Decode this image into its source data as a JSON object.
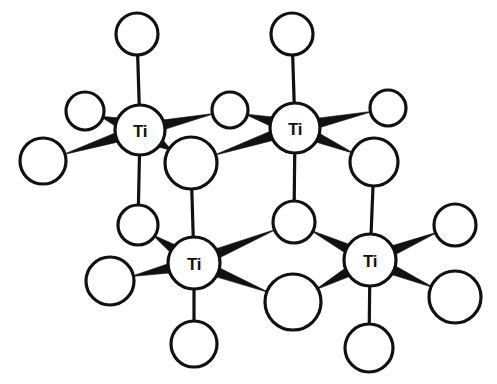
{
  "figure": {
    "kind": "molecular-structure-diagram",
    "background_color": "#ffffff",
    "line_color": "#111111",
    "atom_fill_color": "#ffffff",
    "canvas": {
      "width": 497,
      "height": 384
    }
  },
  "metal_atoms": [
    {
      "id": "ti-top-left",
      "label": "Ti",
      "cx": 140,
      "cy": 130,
      "r": 25
    },
    {
      "id": "ti-top-right",
      "label": "Ti",
      "cx": 295,
      "cy": 128,
      "r": 25
    },
    {
      "id": "ti-bottom-left",
      "label": "Ti",
      "cx": 194,
      "cy": 263,
      "r": 26
    },
    {
      "id": "ti-bottom-right",
      "label": "Ti",
      "cx": 370,
      "cy": 260,
      "r": 26
    }
  ],
  "ligand_atoms": [
    {
      "id": "o-tl-up",
      "cx": 137,
      "cy": 34,
      "r": 21
    },
    {
      "id": "o-tl-upleft",
      "cx": 85,
      "cy": 111,
      "r": 19
    },
    {
      "id": "o-tl-left",
      "cx": 43,
      "cy": 161,
      "r": 23
    },
    {
      "id": "o-tr-up",
      "cx": 292,
      "cy": 34,
      "r": 21
    },
    {
      "id": "o-tr-upright",
      "cx": 388,
      "cy": 108,
      "r": 18
    },
    {
      "id": "o-tr-right",
      "cx": 374,
      "cy": 162,
      "r": 24
    },
    {
      "id": "o-bridge-top",
      "cx": 230,
      "cy": 110,
      "r": 18
    },
    {
      "id": "o-bridge-front",
      "cx": 191,
      "cy": 163,
      "r": 26
    },
    {
      "id": "o-bl-upleft",
      "cx": 138,
      "cy": 225,
      "r": 20
    },
    {
      "id": "o-bl-left",
      "cx": 110,
      "cy": 281,
      "r": 24
    },
    {
      "id": "o-bl-down",
      "cx": 194,
      "cy": 344,
      "r": 23
    },
    {
      "id": "o-bridge-back",
      "cx": 294,
      "cy": 222,
      "r": 21
    },
    {
      "id": "o-bridge-low",
      "cx": 293,
      "cy": 302,
      "r": 28
    },
    {
      "id": "o-br-upright",
      "cx": 455,
      "cy": 225,
      "r": 21
    },
    {
      "id": "o-br-right",
      "cx": 455,
      "cy": 297,
      "r": 26
    },
    {
      "id": "o-br-down",
      "cx": 369,
      "cy": 348,
      "r": 24
    }
  ],
  "wedge_bonds": [
    {
      "id": "bond-tl-upleft",
      "from": "ti-top-left",
      "to": "o-tl-upleft"
    },
    {
      "id": "bond-tl-left",
      "from": "ti-top-left",
      "to": "o-tl-left"
    },
    {
      "id": "bond-tl-bridgetop",
      "from": "ti-top-left",
      "to": "o-bridge-top"
    },
    {
      "id": "bond-tl-bridgefront",
      "from": "ti-top-left",
      "to": "o-bridge-front"
    },
    {
      "id": "bond-tr-bridgetop",
      "from": "ti-top-right",
      "to": "o-bridge-top"
    },
    {
      "id": "bond-tr-bridgefront",
      "from": "ti-top-right",
      "to": "o-bridge-front"
    },
    {
      "id": "bond-tr-upright",
      "from": "ti-top-right",
      "to": "o-tr-upright"
    },
    {
      "id": "bond-tr-right",
      "from": "ti-top-right",
      "to": "o-tr-right"
    },
    {
      "id": "bond-bl-upleft",
      "from": "ti-bottom-left",
      "to": "o-bl-upleft"
    },
    {
      "id": "bond-bl-left",
      "from": "ti-bottom-left",
      "to": "o-bl-left"
    },
    {
      "id": "bond-bl-bridgeback",
      "from": "ti-bottom-left",
      "to": "o-bridge-back"
    },
    {
      "id": "bond-bl-bridgelow",
      "from": "ti-bottom-left",
      "to": "o-bridge-low"
    },
    {
      "id": "bond-br-bridgeback",
      "from": "ti-bottom-right",
      "to": "o-bridge-back"
    },
    {
      "id": "bond-br-bridgelow",
      "from": "ti-bottom-right",
      "to": "o-bridge-low"
    },
    {
      "id": "bond-br-upright",
      "from": "ti-bottom-right",
      "to": "o-br-upright"
    },
    {
      "id": "bond-br-right",
      "from": "ti-bottom-right",
      "to": "o-br-right"
    }
  ],
  "stick_bonds": [
    {
      "id": "stick-tl-up",
      "from": "ti-top-left",
      "to": "o-tl-up"
    },
    {
      "id": "stick-tr-up",
      "from": "ti-top-right",
      "to": "o-tr-up"
    },
    {
      "id": "stick-tl-blupleft",
      "from": "ti-top-left",
      "to": "o-bl-upleft"
    },
    {
      "id": "stick-bridgefront-bl",
      "from": "o-bridge-front",
      "to": "ti-bottom-left"
    },
    {
      "id": "stick-tr-bridgeback",
      "from": "ti-top-right",
      "to": "o-bridge-back"
    },
    {
      "id": "stick-trright-br",
      "from": "o-tr-right",
      "to": "ti-bottom-right"
    },
    {
      "id": "stick-bl-down",
      "from": "ti-bottom-left",
      "to": "o-bl-down"
    },
    {
      "id": "stick-br-down",
      "from": "ti-bottom-right",
      "to": "o-br-down"
    }
  ]
}
